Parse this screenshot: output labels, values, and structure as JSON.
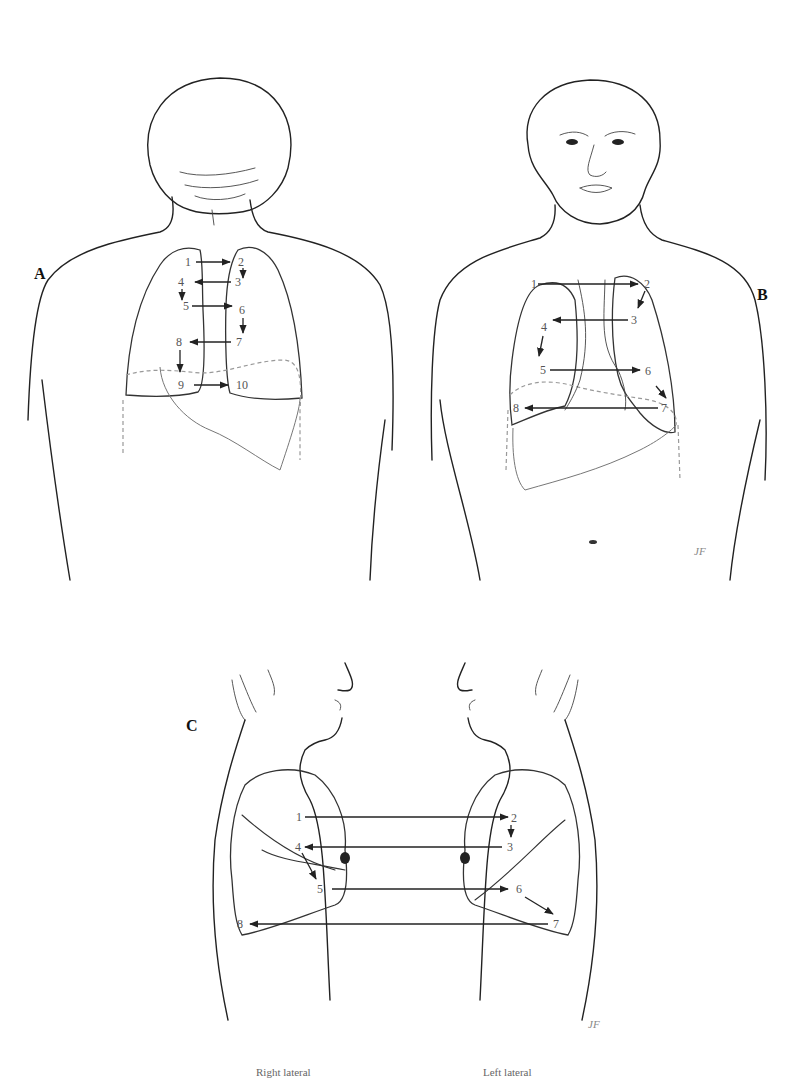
{
  "figure": {
    "panels": [
      {
        "id": "A",
        "label": "A",
        "view": "posterior",
        "points": [
          "1",
          "2",
          "3",
          "4",
          "5",
          "6",
          "7",
          "8",
          "9",
          "10"
        ]
      },
      {
        "id": "B",
        "label": "B",
        "view": "anterior",
        "points": [
          "1",
          "2",
          "3",
          "4",
          "5",
          "6",
          "7",
          "8"
        ]
      },
      {
        "id": "C",
        "label": "C",
        "view": "lateral",
        "points": [
          "1",
          "2",
          "3",
          "4",
          "5",
          "6",
          "7",
          "8"
        ],
        "captions": {
          "right": "Right lateral",
          "left": "Left lateral"
        }
      }
    ],
    "signature": "JF"
  }
}
